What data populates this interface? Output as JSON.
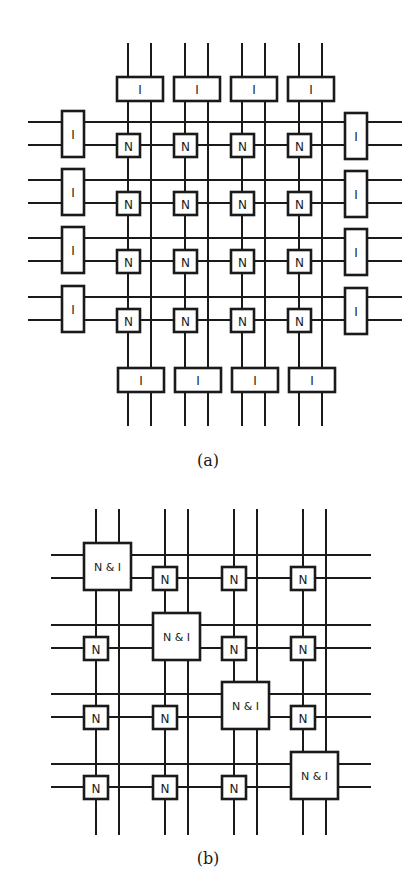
{
  "figure_a": {
    "caption": "(a)",
    "node_label": "N",
    "io_label": "I",
    "grid_size": [
      4,
      4
    ],
    "description": "4x4 grid of N nodes with separate I (I/O) units on all four edges"
  },
  "figure_b": {
    "caption": "(b)",
    "node_label": "N",
    "combined_label": "N & I",
    "grid_size": [
      4,
      4
    ],
    "description": "4x4 grid of N nodes with combined N & I nodes on the diagonal"
  },
  "colors": {
    "ink": "#1a1a1a",
    "background": "#ffffff"
  }
}
